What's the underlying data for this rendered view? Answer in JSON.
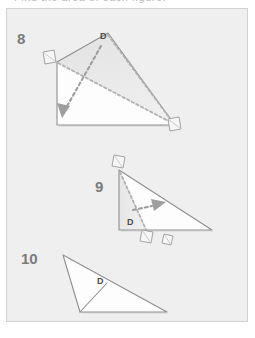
{
  "page": {
    "background_color": "#ffffff",
    "clipped_header_text": "Find the area of each figure."
  },
  "panel": {
    "background_color": "#efefef",
    "border_color": "#d2d2d2",
    "x": 6,
    "y": 8,
    "width": 242,
    "height": 314
  },
  "style": {
    "outline_color": "#8f8f8f",
    "dash_color": "#b4b4b4",
    "arrow_color": "#9a9a9a",
    "shade_color": "#e4e4e4",
    "fill_color": "#fdfdfd",
    "marker_fill": "#f7f7f7",
    "marker_stroke": "#9a9a9a",
    "number_color": "#7b7b7b",
    "label_color": "#4a4a4a"
  },
  "figures": [
    {
      "number": "8",
      "number_label": "8",
      "vertex_label": "D",
      "description": "triangle with shaded upper sub-triangle, dashed cevian from D and dashed base, arrow pointing down-left",
      "outline_points": "57,62 108,33 175,125 57,125",
      "shaded_points": "57,62 108,33 175,125",
      "dashed_segments": [
        "108,33 175,125",
        "57,62 175,125"
      ],
      "arrow": {
        "from": "100,47",
        "to": "62,115"
      },
      "right_angle_markers": [
        {
          "x": 50,
          "y": 56,
          "rotate": -18
        },
        {
          "x": 172,
          "y": 123,
          "rotate": -18
        }
      ]
    },
    {
      "number": "9",
      "number_label": "9",
      "vertex_label": "D",
      "description": "right triangle with dashed cevian from the top vertex to the base, arrow pointing right",
      "outline_points": "119,170 212,230 119,230",
      "shaded_points": "119,170 119,230 145,230",
      "dashed_segments": [
        "119,170 148,233"
      ],
      "arrow": {
        "from": "140,208",
        "to": "167,203"
      },
      "right_angle_markers": [
        {
          "x": 114,
          "y": 160,
          "rotate": 12
        },
        {
          "x": 145,
          "y": 232,
          "rotate": 12
        }
      ]
    },
    {
      "number": "10",
      "number_label": "10",
      "vertex_label": "D",
      "description": "thin obtuse triangle split by a segment from D to the base vertex",
      "outline_points": "63,255 167,312 80,312",
      "shaded_points": "",
      "dashed_segments": [],
      "solid_inner_segments": [
        "106,287 80,312"
      ],
      "arrow": null,
      "right_angle_markers": [
        {
          "x": 166,
          "y": 238,
          "rotate": 12
        }
      ]
    }
  ]
}
